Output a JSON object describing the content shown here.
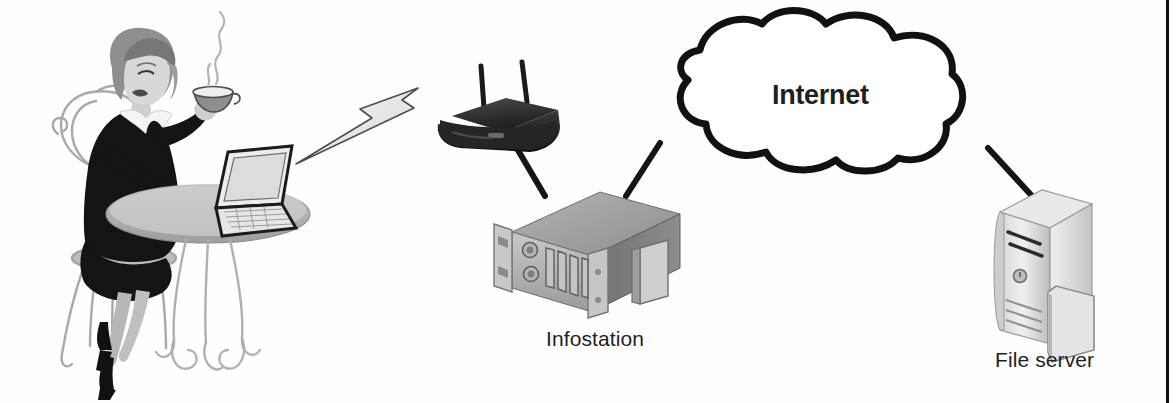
{
  "diagram": {
    "background_color": "#fefefe",
    "border_color": "#111111",
    "nodes": [
      {
        "id": "user",
        "icon": "seated-woman-with-laptop-illustration",
        "label": "",
        "description": "Woman seated at a cafe table holding a coffee cup, using an open laptop"
      },
      {
        "id": "wireless-ap",
        "icon": "wireless-access-point-icon",
        "label": "",
        "description": "Dark wireless access point / router with two antennas"
      },
      {
        "id": "infostation",
        "icon": "rack-server-appliance-icon",
        "label": "Infostation",
        "description": "Grey rack-mount chassis with mounting ears and front ports"
      },
      {
        "id": "internet",
        "icon": "cloud-icon",
        "label": "Internet",
        "description": "Cloud outline representing the public internet"
      },
      {
        "id": "file-server",
        "icon": "tower-server-icon",
        "label": "File server",
        "description": "Light grey tower server computer"
      }
    ],
    "links": [
      {
        "from": "user",
        "to": "wireless-ap",
        "style": "wireless-lightning-bolt"
      },
      {
        "from": "wireless-ap",
        "to": "infostation",
        "style": "solid-cable"
      },
      {
        "from": "infostation",
        "to": "internet",
        "style": "solid-cable"
      },
      {
        "from": "internet",
        "to": "file-server",
        "style": "solid-cable"
      }
    ]
  },
  "labels": {
    "infostation": "Infostation",
    "internet": "Internet",
    "file_server": "File server"
  }
}
